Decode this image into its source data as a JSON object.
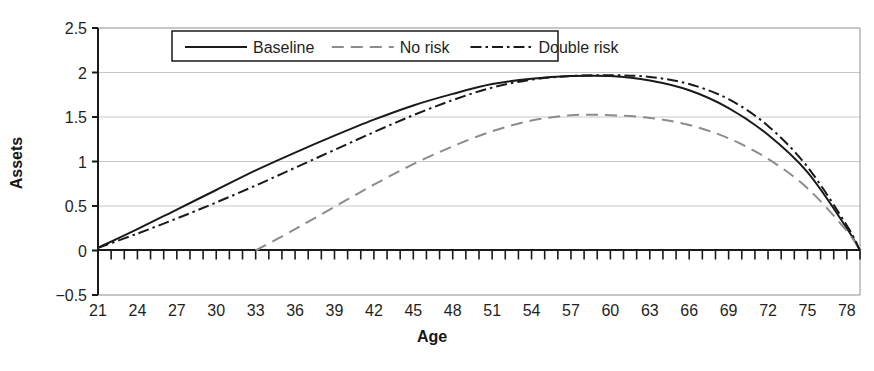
{
  "chart_data": {
    "type": "line",
    "title": "",
    "xlabel": "Age",
    "ylabel": "Assets",
    "xlim": [
      21,
      79
    ],
    "ylim": [
      -0.5,
      2.5
    ],
    "grid": true,
    "legend_position": "top-center",
    "x_ticks": [
      21,
      24,
      27,
      30,
      33,
      36,
      39,
      42,
      45,
      48,
      51,
      54,
      57,
      60,
      63,
      66,
      69,
      72,
      75,
      78
    ],
    "x_minor_tick_step": 1,
    "y_ticks": [
      -0.5,
      0,
      0.5,
      1,
      1.5,
      2,
      2.5
    ],
    "y_tick_labels": [
      "-0.5",
      "0",
      "0.5",
      "1",
      "1.5",
      "2",
      "2.5"
    ],
    "series": [
      {
        "name": "Baseline",
        "style": "solid",
        "color": "#1a1a1a",
        "x": [
          21,
          24,
          27,
          30,
          33,
          36,
          39,
          42,
          45,
          48,
          51,
          54,
          57,
          60,
          63,
          66,
          69,
          72,
          75,
          78,
          79
        ],
        "y": [
          0.03,
          0.24,
          0.46,
          0.68,
          0.9,
          1.1,
          1.29,
          1.47,
          1.63,
          1.76,
          1.87,
          1.93,
          1.96,
          1.96,
          1.91,
          1.8,
          1.6,
          1.3,
          0.88,
          0.25,
          0.0
        ]
      },
      {
        "name": "No risk",
        "style": "dashed",
        "color": "#8c8c8c",
        "x": [
          33,
          36,
          39,
          42,
          45,
          48,
          51,
          54,
          57,
          60,
          63,
          66,
          69,
          72,
          75,
          78,
          79
        ],
        "y": [
          0.0,
          0.24,
          0.49,
          0.74,
          0.97,
          1.17,
          1.34,
          1.46,
          1.52,
          1.52,
          1.49,
          1.41,
          1.26,
          1.03,
          0.7,
          0.22,
          0.0
        ]
      },
      {
        "name": "Double risk",
        "style": "dash-dot",
        "color": "#1a1a1a",
        "x": [
          21,
          24,
          27,
          30,
          33,
          36,
          39,
          42,
          45,
          48,
          51,
          54,
          57,
          60,
          63,
          66,
          69,
          72,
          75,
          78,
          79
        ],
        "y": [
          0.03,
          0.19,
          0.36,
          0.54,
          0.73,
          0.93,
          1.13,
          1.33,
          1.52,
          1.69,
          1.83,
          1.92,
          1.96,
          1.97,
          1.95,
          1.87,
          1.7,
          1.4,
          0.94,
          0.28,
          0.0
        ]
      }
    ]
  },
  "legend": {
    "items": [
      {
        "label": "Baseline",
        "style": "solid"
      },
      {
        "label": "No risk",
        "style": "dashed"
      },
      {
        "label": "Double risk",
        "style": "dash-dot"
      }
    ]
  },
  "axes": {
    "y_title": "Assets",
    "x_title": "Age"
  },
  "colors": {
    "baseline": "#1a1a1a",
    "no_risk": "#8c8c8c",
    "double_risk": "#1a1a1a",
    "grid": "#c8c8c8",
    "axis": "#1a1a1a",
    "background": "#ffffff"
  }
}
